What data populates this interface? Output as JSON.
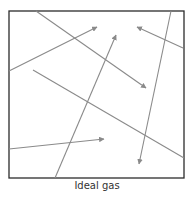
{
  "caption": "Ideal gas",
  "colors": {
    "box": "#2b2b2b",
    "line": "#8a8a8a",
    "arrow": "#8a8a8a",
    "caption": "#333333"
  },
  "box": {
    "x1": 9,
    "y1": 11,
    "x2": 184,
    "y2": 178
  },
  "paths": [
    {
      "name": "particle-path-1",
      "x1": 36,
      "y1": 11,
      "x2": 146,
      "y2": 88,
      "arrow": true
    },
    {
      "name": "particle-path-2",
      "x1": 9,
      "y1": 71,
      "x2": 97,
      "y2": 27,
      "arrow": true
    },
    {
      "name": "particle-path-3",
      "x1": 55,
      "y1": 178,
      "x2": 116,
      "y2": 35,
      "arrow": true
    },
    {
      "name": "particle-path-4",
      "x1": 183,
      "y1": 48,
      "x2": 137,
      "y2": 27,
      "arrow": true
    },
    {
      "name": "particle-path-5",
      "x1": 171,
      "y1": 11,
      "x2": 139,
      "y2": 164,
      "arrow": true
    },
    {
      "name": "particle-path-6",
      "x1": 33,
      "y1": 70,
      "x2": 184,
      "y2": 158,
      "arrow": false
    },
    {
      "name": "particle-path-7",
      "x1": 9,
      "y1": 149,
      "x2": 104,
      "y2": 139,
      "arrow": true
    }
  ]
}
